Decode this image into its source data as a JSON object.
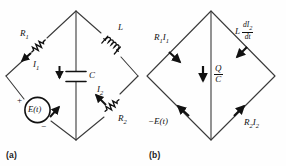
{
  "figure": {
    "background_color": "#fefefe",
    "line_color": "#3a3a3a",
    "ink_color": "#111111"
  },
  "panel_a": {
    "caption": "(a)",
    "description": "Diamond-shaped RLC circuit with source",
    "components": [
      {
        "name": "resistor-r1",
        "type": "resistor",
        "label": "R",
        "label_sub": "1",
        "branch": "upper-left"
      },
      {
        "name": "inductor-l",
        "type": "inductor",
        "label": "L",
        "label_sub": "",
        "branch": "upper-right"
      },
      {
        "name": "capacitor-c",
        "type": "capacitor",
        "label": "C",
        "label_sub": "",
        "branch": "center-vertical"
      },
      {
        "name": "source-et",
        "type": "voltage-source",
        "label": "E(t)",
        "label_sub": "",
        "branch": "lower-left"
      },
      {
        "name": "resistor-r2",
        "type": "resistor",
        "label": "R",
        "label_sub": "2",
        "branch": "lower-right"
      }
    ],
    "currents": [
      {
        "name": "current-i1",
        "label": "I",
        "sub": "1"
      },
      {
        "name": "current-i2",
        "label": "I",
        "sub": "2"
      }
    ],
    "polarity": {
      "plus": "+",
      "minus": "−"
    }
  },
  "panel_b": {
    "caption": "(b)",
    "description": "Voltage drops around the same diamond loop",
    "drops": [
      {
        "name": "drop-r1i1",
        "branch": "upper-left",
        "label": "R",
        "sub1": "1",
        "label2": "I",
        "sub2": "1",
        "arrow": "down-right"
      },
      {
        "name": "drop-l-didt",
        "branch": "upper-right",
        "label": "L",
        "numerator_d": "d",
        "numerator_var": "I",
        "numerator_sub": "2",
        "denominator": "dt",
        "arrow": "down-right"
      },
      {
        "name": "drop-q-over-c",
        "branch": "center-vertical",
        "numerator": "Q",
        "denominator": "C",
        "arrow": "down"
      },
      {
        "name": "drop-neg-et",
        "branch": "lower-left",
        "label": "−E(t)",
        "arrow": "up-right"
      },
      {
        "name": "drop-r2i2",
        "branch": "lower-right",
        "label": "R",
        "sub1": "2",
        "label2": "I",
        "sub2": "2",
        "arrow": "up-right"
      }
    ]
  }
}
